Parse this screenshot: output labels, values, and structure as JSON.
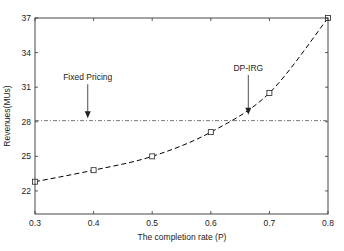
{
  "chart_data": {
    "type": "line",
    "title": "",
    "xlabel": "The completion rate (P)",
    "ylabel": "Revenues(MUs)",
    "xlim": [
      0.3,
      0.8
    ],
    "ylim": [
      20,
      37
    ],
    "xticks": [
      0.3,
      0.4,
      0.5,
      0.6,
      0.7,
      0.8
    ],
    "xtick_labels": [
      "0.3",
      "0.4",
      "0.5",
      "0.6",
      "0.7",
      "0.8"
    ],
    "yticks": [
      22,
      25,
      28,
      31,
      34,
      37
    ],
    "ytick_labels": [
      "22",
      "25",
      "28",
      "31",
      "34",
      "37"
    ],
    "grid": false,
    "legend": null,
    "series": [
      {
        "name": "DP-IRG",
        "style": "dashed",
        "marker": "square",
        "color": "#000000",
        "x": [
          0.3,
          0.4,
          0.5,
          0.6,
          0.7,
          0.8
        ],
        "values": [
          22.8,
          23.8,
          25.0,
          27.1,
          30.5,
          37.0
        ]
      },
      {
        "name": "Fixed Pricing",
        "style": "dash-dot",
        "marker": "none",
        "color": "#555555",
        "x": [
          0.3,
          0.8
        ],
        "values": [
          28.1,
          28.1
        ]
      }
    ],
    "annotations": [
      {
        "text": "Fixed Pricing",
        "text_x": 0.39,
        "text_y": 31.6,
        "arrow_to_x": 0.39,
        "arrow_to_y": 28.3
      },
      {
        "text": "DP-IRG",
        "text_x": 0.664,
        "text_y": 32.4,
        "arrow_to_x": 0.664,
        "arrow_to_y": 28.6
      }
    ]
  }
}
